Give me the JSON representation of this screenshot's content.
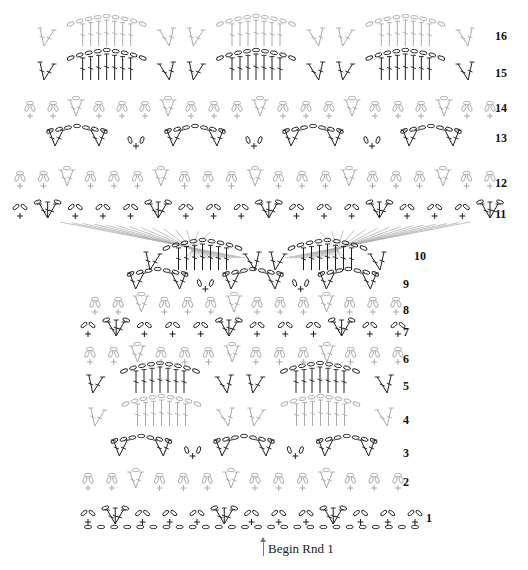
{
  "diagram": {
    "type": "crochet-stitch-chart",
    "colors": {
      "dark": "#1c1c1c",
      "light": "#a9a9a9",
      "background": "#ffffff"
    },
    "faint_header": "·····",
    "begin": {
      "label": "Begin Rnd 1",
      "arrow_x": 263,
      "arrow_top": 541,
      "arrow_bottom": 556,
      "label_x": 268,
      "label_y": 541
    },
    "rows": [
      {
        "n": "1",
        "label": "1",
        "label_x": 426,
        "label_y": 512,
        "y": 518,
        "x0": 88,
        "x1": 415,
        "tone": "dark",
        "kind": "shell-base"
      },
      {
        "n": "2",
        "label": "2",
        "label_x": 403,
        "label_y": 476,
        "y": 482,
        "x0": 88,
        "x1": 398,
        "tone": "light",
        "kind": "arches"
      },
      {
        "n": "3",
        "label": "3",
        "label_x": 403,
        "label_y": 447,
        "y": 450,
        "x0": 90,
        "x1": 398,
        "tone": "dark",
        "kind": "fans"
      },
      {
        "n": "4",
        "label": "4",
        "label_x": 403,
        "label_y": 414,
        "y": 418,
        "x0": 82,
        "x1": 400,
        "tone": "light",
        "kind": "tall-fans"
      },
      {
        "n": "5",
        "label": "5",
        "label_x": 403,
        "label_y": 380,
        "y": 385,
        "x0": 80,
        "x1": 400,
        "tone": "dark",
        "kind": "tall-fans"
      },
      {
        "n": "6",
        "label": "6",
        "label_x": 403,
        "label_y": 353,
        "y": 356,
        "x0": 90,
        "x1": 398,
        "tone": "light",
        "kind": "arches"
      },
      {
        "n": "7",
        "label": "7",
        "label_x": 403,
        "label_y": 326,
        "y": 330,
        "x0": 88,
        "x1": 398,
        "tone": "dark",
        "kind": "shell-base"
      },
      {
        "n": "8",
        "label": "8",
        "label_x": 403,
        "label_y": 304,
        "y": 306,
        "x0": 95,
        "x1": 396,
        "tone": "light",
        "kind": "arches"
      },
      {
        "n": "9",
        "label": "9",
        "label_x": 403,
        "label_y": 278,
        "y": 283,
        "x0": 110,
        "x1": 396,
        "tone": "dark",
        "kind": "fans"
      },
      {
        "n": "10",
        "label": "10",
        "label_x": 414,
        "label_y": 250,
        "y": 262,
        "x0": 140,
        "x1": 390,
        "tone": "dark",
        "kind": "tall-fans"
      },
      {
        "n": "11",
        "label": "11",
        "label_x": 495,
        "label_y": 208,
        "y": 212,
        "x0": 20,
        "x1": 490,
        "tone": "dark",
        "kind": "shell-base"
      },
      {
        "n": "12",
        "label": "12",
        "label_x": 495,
        "label_y": 177,
        "y": 180,
        "x0": 20,
        "x1": 490,
        "tone": "light",
        "kind": "arches"
      },
      {
        "n": "13",
        "label": "13",
        "label_x": 495,
        "label_y": 132,
        "y": 140,
        "x0": 18,
        "x1": 490,
        "tone": "dark",
        "kind": "fans"
      },
      {
        "n": "14",
        "label": "14",
        "label_x": 495,
        "label_y": 102,
        "y": 110,
        "x0": 30,
        "x1": 490,
        "tone": "light",
        "kind": "arches"
      },
      {
        "n": "15",
        "label": "15",
        "label_x": 495,
        "label_y": 67,
        "y": 72,
        "x0": 32,
        "x1": 480,
        "tone": "dark",
        "kind": "tall-fans"
      },
      {
        "n": "16",
        "label": "16",
        "label_x": 495,
        "label_y": 30,
        "y": 38,
        "x0": 32,
        "x1": 480,
        "tone": "light",
        "kind": "tall-fans"
      }
    ],
    "foundation_chain": {
      "y": 527,
      "x0": 88,
      "x1": 415,
      "count": 26,
      "tone": "dark"
    },
    "fan_spokes": {
      "cx": 265,
      "cy": 228,
      "tone": "light",
      "left_x": 60,
      "right_x": 470,
      "top_y": 232,
      "count": 14
    }
  }
}
